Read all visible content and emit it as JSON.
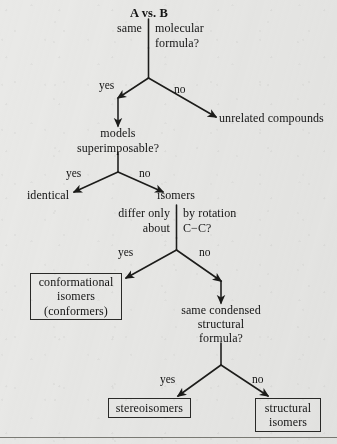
{
  "diagram": {
    "title": "A vs. B",
    "type": "decision-flowchart",
    "question1": {
      "left_label": "same",
      "right_label_line1": "molecular",
      "right_label_line2": "formula?",
      "yes": "yes",
      "no": "no"
    },
    "unrelated": "unrelated compounds",
    "question2": {
      "line1": "models",
      "line2": "superimposable?",
      "yes": "yes",
      "no": "no"
    },
    "identical": "identical",
    "isomers": "isomers",
    "question3": {
      "left_line1": "differ only",
      "left_line2": "about",
      "right_line1": "by rotation",
      "right_line2": "C−C?",
      "yes": "yes",
      "no": "no"
    },
    "conformational_box": {
      "line1": "conformational",
      "line2": "isomers",
      "line3": "(conformers)"
    },
    "question4": {
      "line1": "same condensed",
      "line2": "structural",
      "line3": "formula?",
      "yes": "yes",
      "no": "no"
    },
    "stereoisomers_box": {
      "line1": "stereoisomers"
    },
    "structural_box": {
      "line1": "structural",
      "line2": "isomers"
    },
    "colors": {
      "ink": "#141414",
      "paper": "#e9e9e7",
      "rule": "#55554f"
    }
  }
}
